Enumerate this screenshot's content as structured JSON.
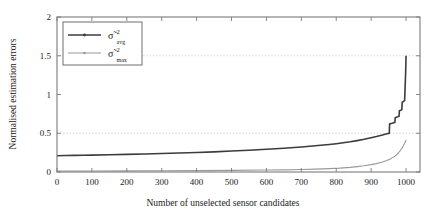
{
  "chart_data": {
    "type": "line",
    "title": "",
    "xlabel": "Number of unselected sensor candidates",
    "ylabel": "Normalised estimation errors",
    "xlim": [
      0,
      1040
    ],
    "ylim": [
      0,
      2
    ],
    "xticks": [
      0,
      100,
      200,
      300,
      400,
      500,
      600,
      700,
      800,
      900,
      1000
    ],
    "xticklabels": [
      "0",
      "100",
      "200",
      "300",
      "400",
      "500",
      "600",
      "700",
      "800",
      "900",
      "1000"
    ],
    "yticks": [
      0,
      0.5,
      1,
      1.5,
      2
    ],
    "yticklabels": [
      "0",
      "0.5",
      "1",
      "1.5",
      "2"
    ],
    "grid": "dotted horizontal gridlines at y=0.5 and y=1.5",
    "gridlines_y": [
      0.5,
      1.5
    ],
    "legend_position": "upper left",
    "series": [
      {
        "name": "sigma_avg",
        "label_base": "σ̃",
        "label_sup": "2",
        "label_sub": "avg",
        "color": "#3c3c3c",
        "marker": "dot",
        "x": [
          0,
          25,
          50,
          75,
          100,
          150,
          200,
          250,
          300,
          350,
          400,
          450,
          500,
          550,
          600,
          650,
          700,
          740,
          780,
          800,
          820,
          840,
          860,
          880,
          900,
          915,
          930,
          945,
          952,
          953,
          960,
          968,
          969,
          976,
          980,
          981,
          986,
          988,
          989,
          994,
          996,
          997,
          999,
          1000
        ],
        "y": [
          0.21,
          0.212,
          0.214,
          0.216,
          0.218,
          0.222,
          0.227,
          0.232,
          0.238,
          0.245,
          0.252,
          0.26,
          0.27,
          0.281,
          0.293,
          0.307,
          0.323,
          0.338,
          0.355,
          0.365,
          0.377,
          0.39,
          0.405,
          0.422,
          0.443,
          0.458,
          0.475,
          0.493,
          0.5,
          0.62,
          0.628,
          0.64,
          0.7,
          0.712,
          0.72,
          0.79,
          0.8,
          0.805,
          0.9,
          0.915,
          0.925,
          1.05,
          1.3,
          1.5
        ]
      },
      {
        "name": "sigma_max",
        "label_base": "σ̃",
        "label_sup": "2",
        "label_sub": "max",
        "color": "#9a9a9a",
        "marker": "dot",
        "x": [
          0,
          100,
          200,
          300,
          400,
          500,
          600,
          650,
          700,
          740,
          780,
          810,
          840,
          860,
          880,
          900,
          915,
          930,
          945,
          955,
          965,
          972,
          978,
          984,
          988,
          992,
          995,
          998,
          1000
        ],
        "y": [
          0.012,
          0.013,
          0.014,
          0.016,
          0.018,
          0.021,
          0.025,
          0.028,
          0.032,
          0.037,
          0.043,
          0.05,
          0.06,
          0.069,
          0.08,
          0.095,
          0.108,
          0.125,
          0.148,
          0.168,
          0.195,
          0.218,
          0.245,
          0.28,
          0.305,
          0.335,
          0.36,
          0.39,
          0.41
        ]
      }
    ]
  },
  "axes": {
    "ylabel": "Normalised estimation errors",
    "xlabel": "Number of unselected sensor candidates"
  }
}
